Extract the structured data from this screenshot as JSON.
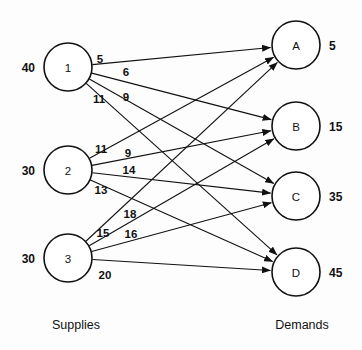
{
  "diagram": {
    "type": "bipartite-transportation-network",
    "captions": {
      "left": "Supplies",
      "right": "Demands"
    },
    "supply_nodes": [
      {
        "id": "1",
        "label": "1",
        "amount": "40",
        "cx": 68,
        "cy": 67,
        "r": 24
      },
      {
        "id": "2",
        "label": "2",
        "amount": "30",
        "cx": 68,
        "cy": 170,
        "r": 24
      },
      {
        "id": "3",
        "label": "3",
        "amount": "30",
        "cx": 68,
        "cy": 258,
        "r": 24
      }
    ],
    "demand_nodes": [
      {
        "id": "A",
        "label": "A",
        "amount": "5",
        "cx": 296,
        "cy": 45,
        "r": 24
      },
      {
        "id": "B",
        "label": "B",
        "amount": "15",
        "cx": 296,
        "cy": 126,
        "r": 24
      },
      {
        "id": "C",
        "label": "C",
        "amount": "35",
        "cx": 296,
        "cy": 196,
        "r": 24
      },
      {
        "id": "D",
        "label": "D",
        "amount": "45",
        "cx": 296,
        "cy": 272,
        "r": 24
      }
    ],
    "edges": [
      {
        "from": "1",
        "to": "A",
        "cost": "5",
        "lx": 100,
        "ly": 59
      },
      {
        "from": "1",
        "to": "B",
        "cost": "6",
        "lx": 126,
        "ly": 72
      },
      {
        "from": "1",
        "to": "C",
        "cost": "9",
        "lx": 126,
        "ly": 97
      },
      {
        "from": "1",
        "to": "D",
        "cost": "11",
        "lx": 99,
        "ly": 99
      },
      {
        "from": "2",
        "to": "A",
        "cost": "11",
        "lx": 101,
        "ly": 149
      },
      {
        "from": "2",
        "to": "B",
        "cost": "9",
        "lx": 128,
        "ly": 153
      },
      {
        "from": "2",
        "to": "C",
        "cost": "14",
        "lx": 129,
        "ly": 170
      },
      {
        "from": "2",
        "to": "D",
        "cost": "13",
        "lx": 101,
        "ly": 190
      },
      {
        "from": "3",
        "to": "A",
        "cost": "18",
        "lx": 130,
        "ly": 214
      },
      {
        "from": "3",
        "to": "B",
        "cost": "15",
        "lx": 103,
        "ly": 233
      },
      {
        "from": "3",
        "to": "C",
        "cost": "16",
        "lx": 131,
        "ly": 234
      },
      {
        "from": "3",
        "to": "D",
        "cost": "20",
        "lx": 105,
        "ly": 275
      }
    ],
    "caption_positions": {
      "left": {
        "x": 76,
        "y": 325
      },
      "right": {
        "x": 302,
        "y": 325
      }
    },
    "colors": {
      "stroke": "#111111",
      "node_fill": "#ffffff",
      "background": "#fdfdfd"
    }
  }
}
